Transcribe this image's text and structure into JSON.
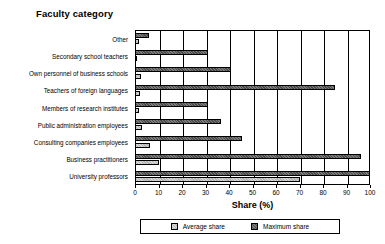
{
  "chart_data": {
    "type": "bar",
    "orientation": "horizontal",
    "title": "Faculty category",
    "xlabel": "Share (%)",
    "ylabel": "",
    "xlim": [
      0,
      100
    ],
    "xticks": [
      0,
      10,
      20,
      30,
      40,
      50,
      60,
      70,
      80,
      90,
      100
    ],
    "grid": true,
    "legend_position": "bottom",
    "categories": [
      "Other",
      "Secondary school teachers",
      "Own personnel of business schools",
      "Teachers of foreign languages",
      "Members of research institutes",
      "Public administration employees",
      "Consulting companies employees",
      "Business practitioners",
      "University professors"
    ],
    "series": [
      {
        "name": "Average share",
        "color": "#b4b4b4",
        "values": [
          1.5,
          1.0,
          2.5,
          2.0,
          1.5,
          3.0,
          6.5,
          10.0,
          70.0
        ]
      },
      {
        "name": "Maximum share",
        "color": "#4a4a4a",
        "values": [
          6.0,
          31.0,
          41.0,
          85.0,
          31.0,
          36.5,
          45.5,
          96.0,
          100.0
        ]
      }
    ]
  },
  "legend": {
    "items": [
      {
        "label": "Average share",
        "swatch": "avg"
      },
      {
        "label": "Maximum share",
        "swatch": "max"
      }
    ]
  }
}
